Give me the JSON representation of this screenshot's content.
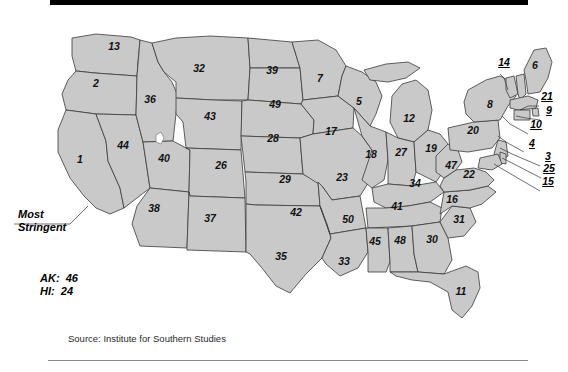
{
  "figure": {
    "source_note": "Source:  Institute for Southern Studies",
    "legend_label_line1": "Most",
    "legend_label_line2": "Stringent",
    "noncontiguous": [
      {
        "abbr": "AK:",
        "rank": "46"
      },
      {
        "abbr": "HI:",
        "rank": "24"
      }
    ],
    "colors": {
      "state_fill": "#c9c9c9",
      "state_stroke": "#3a3a3a",
      "text": "#111111",
      "top_bar": "#000000",
      "bottom_rule": "#8a8a8a",
      "background": "#ffffff"
    }
  },
  "map_data": {
    "type": "choropleth-rank-map",
    "title": "",
    "value_label": "rank",
    "inline_states": [
      {
        "name": "California",
        "abbr": "CA",
        "rank": "1",
        "x": 80,
        "y": 159
      },
      {
        "name": "Oregon",
        "abbr": "OR",
        "rank": "2",
        "x": 96,
        "y": 83
      },
      {
        "name": "Wisconsin",
        "abbr": "WI",
        "rank": "5",
        "x": 359,
        "y": 101
      },
      {
        "name": "Maine",
        "abbr": "ME",
        "rank": "6",
        "x": 535,
        "y": 65
      },
      {
        "name": "Minnesota",
        "abbr": "MN",
        "rank": "7",
        "x": 320,
        "y": 78
      },
      {
        "name": "New York",
        "abbr": "NY",
        "rank": "8",
        "x": 490,
        "y": 104
      },
      {
        "name": "Florida",
        "abbr": "FL",
        "rank": "11",
        "x": 461,
        "y": 291
      },
      {
        "name": "Michigan",
        "abbr": "MI",
        "rank": "12",
        "x": 409,
        "y": 118
      },
      {
        "name": "Washington",
        "abbr": "WA",
        "rank": "13",
        "x": 114,
        "y": 46
      },
      {
        "name": "North Carolina",
        "abbr": "NC",
        "rank": "16",
        "x": 452,
        "y": 199
      },
      {
        "name": "Iowa",
        "abbr": "IA",
        "rank": "17",
        "x": 331,
        "y": 131
      },
      {
        "name": "Illinois",
        "abbr": "IL",
        "rank": "18",
        "x": 371,
        "y": 154
      },
      {
        "name": "Ohio",
        "abbr": "OH",
        "rank": "19",
        "x": 431,
        "y": 148
      },
      {
        "name": "Pennsylvania",
        "abbr": "PA",
        "rank": "20",
        "x": 473,
        "y": 130
      },
      {
        "name": "Virginia",
        "abbr": "VA",
        "rank": "22",
        "x": 469,
        "y": 174
      },
      {
        "name": "Missouri",
        "abbr": "MO",
        "rank": "23",
        "x": 342,
        "y": 177
      },
      {
        "name": "Colorado",
        "abbr": "CO",
        "rank": "26",
        "x": 221,
        "y": 165
      },
      {
        "name": "Indiana",
        "abbr": "IN",
        "rank": "27",
        "x": 401,
        "y": 152
      },
      {
        "name": "Nebraska",
        "abbr": "NE",
        "rank": "28",
        "x": 273,
        "y": 138
      },
      {
        "name": "Kansas",
        "abbr": "KS",
        "rank": "29",
        "x": 285,
        "y": 179
      },
      {
        "name": "Georgia",
        "abbr": "GA",
        "rank": "30",
        "x": 432,
        "y": 239
      },
      {
        "name": "South Carolina",
        "abbr": "SC",
        "rank": "31",
        "x": 459,
        "y": 219
      },
      {
        "name": "Montana",
        "abbr": "MT",
        "rank": "32",
        "x": 199,
        "y": 68
      },
      {
        "name": "Louisiana",
        "abbr": "LA",
        "rank": "33",
        "x": 344,
        "y": 261
      },
      {
        "name": "Kentucky",
        "abbr": "KY",
        "rank": "34",
        "x": 415,
        "y": 183
      },
      {
        "name": "Texas",
        "abbr": "TX",
        "rank": "35",
        "x": 281,
        "y": 256
      },
      {
        "name": "Idaho",
        "abbr": "ID",
        "rank": "36",
        "x": 150,
        "y": 99
      },
      {
        "name": "New Mexico",
        "abbr": "NM",
        "rank": "37",
        "x": 210,
        "y": 218
      },
      {
        "name": "Arizona",
        "abbr": "AZ",
        "rank": "38",
        "x": 154,
        "y": 208
      },
      {
        "name": "North Dakota",
        "abbr": "ND",
        "rank": "39",
        "x": 272,
        "y": 70
      },
      {
        "name": "Utah",
        "abbr": "UT",
        "rank": "40",
        "x": 164,
        "y": 158
      },
      {
        "name": "Tennessee",
        "abbr": "TN",
        "rank": "41",
        "x": 397,
        "y": 206
      },
      {
        "name": "Oklahoma",
        "abbr": "OK",
        "rank": "42",
        "x": 296,
        "y": 212
      },
      {
        "name": "Wyoming",
        "abbr": "WY",
        "rank": "43",
        "x": 210,
        "y": 116
      },
      {
        "name": "Nevada",
        "abbr": "NV",
        "rank": "44",
        "x": 123,
        "y": 145
      },
      {
        "name": "Mississippi",
        "abbr": "MS",
        "rank": "45",
        "x": 375,
        "y": 241
      },
      {
        "name": "West Virginia",
        "abbr": "WV",
        "rank": "47",
        "x": 451,
        "y": 165
      },
      {
        "name": "Alabama",
        "abbr": "AL",
        "rank": "48",
        "x": 400,
        "y": 240
      },
      {
        "name": "South Dakota",
        "abbr": "SD",
        "rank": "49",
        "x": 275,
        "y": 104
      },
      {
        "name": "Arkansas",
        "abbr": "AR",
        "rank": "50",
        "x": 348,
        "y": 219
      }
    ],
    "callout_states": [
      {
        "name": "Vermont",
        "abbr": "VT",
        "rank": "14",
        "lx": 504,
        "ly": 62,
        "tx": 518,
        "ty": 86
      },
      {
        "name": "Maryland",
        "abbr": "MD",
        "rank": "15",
        "lx": 548,
        "ly": 181,
        "tx": 496,
        "ty": 157
      },
      {
        "name": "Rhode Island",
        "abbr": "RI",
        "rank": "21",
        "lx": 547,
        "ly": 96,
        "tx": 521,
        "ty": 104
      },
      {
        "name": "Delaware",
        "abbr": "DE",
        "rank": "25",
        "lx": 549,
        "ly": 168,
        "tx": 497,
        "ty": 150
      },
      {
        "name": "New Jersey",
        "abbr": "NJ",
        "rank": "3",
        "lx": 548,
        "ly": 156,
        "tx": 494,
        "ty": 140
      },
      {
        "name": "New Hampshire",
        "abbr": "NH",
        "rank": "4",
        "lx": 532,
        "ly": 143,
        "tx": 504,
        "ty": 92
      },
      {
        "name": "Connecticut",
        "abbr": "CT",
        "rank": "9",
        "lx": 549,
        "ly": 110,
        "tx": 514,
        "ty": 110
      },
      {
        "name": "Massachusetts",
        "abbr": "MA",
        "rank": "10",
        "lx": 536,
        "ly": 124,
        "tx": 505,
        "ty": 104
      }
    ]
  }
}
